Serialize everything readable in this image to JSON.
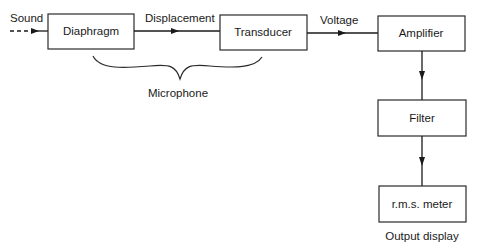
{
  "diagram": {
    "input_label": "Sound",
    "blocks": [
      {
        "id": "diaphragm",
        "label": "Diaphragm"
      },
      {
        "id": "transducer",
        "label": "Transducer"
      },
      {
        "id": "amplifier",
        "label": "Amplifier"
      },
      {
        "id": "filter",
        "label": "Filter"
      },
      {
        "id": "rms-meter",
        "label": "r.m.s. meter"
      }
    ],
    "connections": [
      {
        "from": "input",
        "to": "diaphragm",
        "label": "Sound",
        "style": "dashed"
      },
      {
        "from": "diaphragm",
        "to": "transducer",
        "label": "Displacement"
      },
      {
        "from": "transducer",
        "to": "amplifier",
        "label": "Voltage"
      },
      {
        "from": "amplifier",
        "to": "filter",
        "label": ""
      },
      {
        "from": "filter",
        "to": "rms-meter",
        "label": ""
      }
    ],
    "group_label": "Microphone",
    "group_members": [
      "diaphragm",
      "transducer"
    ],
    "output_caption": "Output display",
    "colors": {
      "stroke": "#1a1a1a",
      "background": "#ffffff"
    }
  }
}
